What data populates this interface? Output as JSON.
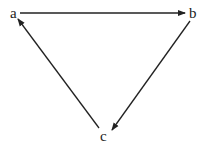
{
  "diagram": {
    "type": "directed-cycle-graph",
    "nodes": [
      {
        "id": "a",
        "label": "a",
        "x": 14,
        "y": 17
      },
      {
        "id": "b",
        "label": "b",
        "x": 193,
        "y": 17
      },
      {
        "id": "c",
        "label": "c",
        "x": 104,
        "y": 141
      }
    ],
    "edges": [
      {
        "from": "a",
        "to": "b"
      },
      {
        "from": "b",
        "to": "c"
      },
      {
        "from": "c",
        "to": "a"
      }
    ],
    "colors": {
      "stroke": "#222222",
      "background": "#ffffff"
    }
  }
}
